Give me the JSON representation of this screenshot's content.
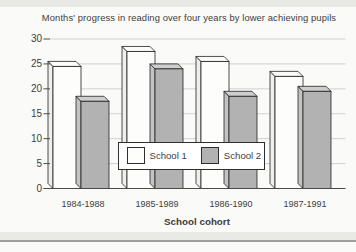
{
  "colors": {
    "background": "#fafaf8",
    "band": "#e9e9e6",
    "band_line": "#9e9e9e",
    "text": "#3d3d3d",
    "grid": "#c6c6c6",
    "axis": "#4a4a4a",
    "outline": "#222222"
  },
  "chart_data": {
    "type": "bar",
    "style": "3d-offset-bars",
    "title": "Months' progress in reading over four years by lower achieving pupils",
    "xlabel": "School cohort",
    "ylabel": "",
    "categories": [
      "1984-1988",
      "1985-1989",
      "1986-1990",
      "1987-1991"
    ],
    "series": [
      {
        "name": "School 1",
        "values": [
          24.5,
          27.5,
          25.5,
          22.5
        ],
        "front_color": "#fdfdfc",
        "top_color": "#fbfbfa",
        "side_color": "#efefed"
      },
      {
        "name": "School 2",
        "values": [
          17.5,
          24,
          18.5,
          19.5
        ],
        "front_color": "#b2b2b2",
        "top_color": "#cecece",
        "side_color": "#c4c4c4"
      }
    ],
    "ylim": [
      0,
      30
    ],
    "yticks": [
      0,
      5,
      10,
      15,
      20,
      25,
      30
    ],
    "grid": "horizontal",
    "legend_position": "inside-center"
  }
}
